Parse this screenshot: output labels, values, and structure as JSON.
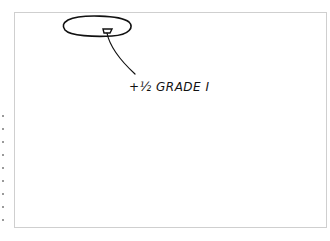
{
  "diagram": {
    "type": "hand-drawn sketch",
    "annotation": {
      "text": "+½ GRADE I"
    },
    "shapes": [
      {
        "kind": "ellipse",
        "description": "large oval outline"
      },
      {
        "kind": "small-trapezoid",
        "description": "small marker inside oval"
      },
      {
        "kind": "leader-line",
        "description": "line connecting marker to annotation"
      }
    ],
    "colors": {
      "ink": "#111111",
      "frame": "#cfcfcf",
      "background": "#ffffff"
    }
  }
}
